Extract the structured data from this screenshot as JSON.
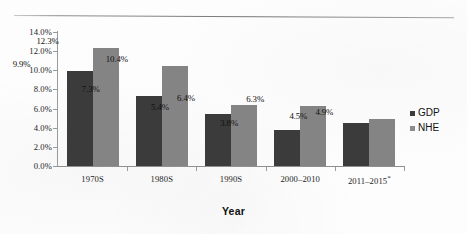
{
  "chart_data": {
    "type": "bar",
    "title": "",
    "xlabel": "Year",
    "ylabel": "",
    "ylim": [
      0,
      14
    ],
    "grid": false,
    "legend_position": "right",
    "categories": [
      "1970S",
      "1980S",
      "1990S",
      "2000–2010",
      "2011–2015*"
    ],
    "y_ticks": [
      "0.0%",
      "2.0%",
      "4.0%",
      "6.0%",
      "8.0%",
      "10.0%",
      "12.0%",
      "14.0%"
    ],
    "y_tick_values": [
      0,
      2,
      4,
      6,
      8,
      10,
      12,
      14
    ],
    "series": [
      {
        "name": "GDP",
        "color": "#3b3b3b",
        "values": [
          9.9,
          7.3,
          5.4,
          3.8,
          4.5
        ],
        "labels": [
          "9.9%",
          "7.3%",
          "5.4%",
          "3.8%",
          "4.5%"
        ]
      },
      {
        "name": "NHE",
        "color": "#848484",
        "values": [
          12.3,
          10.4,
          6.4,
          6.3,
          4.9
        ],
        "labels": [
          "12.3%",
          "10.4%",
          "6.4%",
          "6.3%",
          "4.9%"
        ]
      }
    ]
  },
  "legend": {
    "items": [
      {
        "label": "GDP",
        "color": "#3b3b3b"
      },
      {
        "label": "NHE",
        "color": "#8c8c8c"
      }
    ]
  },
  "axis": {
    "x_title": "Year"
  }
}
